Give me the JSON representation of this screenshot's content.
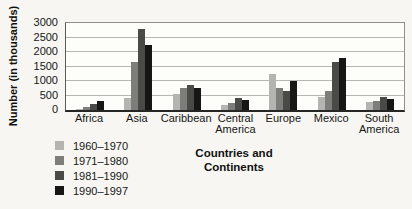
{
  "chart_data": {
    "type": "bar",
    "title": "",
    "ylabel": "Number (in thousands)",
    "xlabel": "Countries and Continents",
    "xlabel_lines": [
      "Countries and",
      "Continents"
    ],
    "ylim": [
      0,
      3000
    ],
    "yticks": [
      0,
      500,
      1000,
      1500,
      2000,
      2500,
      3000
    ],
    "grid": true,
    "legend_position": "bottom-left",
    "categories": [
      "Africa",
      "Asia",
      "Caribbean",
      "Central America",
      "Europe",
      "Mexico",
      "South America"
    ],
    "series": [
      {
        "name": "1960–1970",
        "color": "#b4b4b0",
        "values": [
          50,
          400,
          550,
          175,
          1250,
          450,
          275
        ]
      },
      {
        "name": "1971–1980",
        "color": "#7d7d7a",
        "values": [
          100,
          1650,
          750,
          250,
          750,
          650,
          325
        ]
      },
      {
        "name": "1981–1990",
        "color": "#4a4a47",
        "values": [
          200,
          2800,
          875,
          425,
          650,
          1650,
          450
        ]
      },
      {
        "name": "1990–1997",
        "color": "#161614",
        "values": [
          300,
          2250,
          750,
          350,
          1000,
          1800,
          375
        ]
      }
    ],
    "colors": {
      "gridline": "#b6b6b2",
      "plot_background": "#fdfdfa",
      "page_background": "#f7f6f2",
      "axis": "#262624"
    }
  }
}
